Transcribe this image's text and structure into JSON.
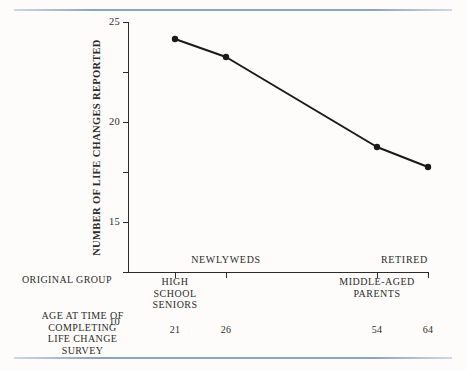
{
  "chart_data": {
    "type": "line",
    "title": "",
    "xlabel": "",
    "ylabel": "NUMBER OF LIFE CHANGES REPORTED",
    "ylim": [
      0,
      25
    ],
    "yticks": [
      0,
      5,
      10,
      15,
      20,
      25
    ],
    "ytick_labels": [
      "0",
      "5",
      "10",
      "15",
      "20",
      "25"
    ],
    "grid": false,
    "legend": "none",
    "categories": [
      "HIGH SCHOOL SENIORS",
      "NEWLYWEDS",
      "MIDDLE-AGED PARENTS",
      "RETIRED"
    ],
    "x": [
      21,
      26,
      54,
      64
    ],
    "values": [
      23.3,
      21.5,
      12.5,
      10.5
    ],
    "marker": "filled-circle",
    "line_color": "#1a1a1a"
  },
  "axis": {
    "y_title": "NUMBER OF LIFE CHANGES REPORTED",
    "y_ticks": [
      {
        "value": 25,
        "label": "25"
      },
      {
        "value": 20,
        "label": "20"
      },
      {
        "value": 15,
        "label": "15"
      },
      {
        "value": 10,
        "label": "10"
      },
      {
        "value": 5,
        "label": "5"
      },
      {
        "value": 0,
        "label": "0"
      }
    ]
  },
  "rows": {
    "group_title": "ORIGINAL GROUP",
    "age_title_lines": [
      "AGE AT TIME OF",
      "COMPLETING",
      "LIFE CHANGE",
      "SURVEY"
    ]
  },
  "points": [
    {
      "group_label_lines": [
        "HIGH",
        "SCHOOL",
        "SENIORS"
      ],
      "group_label_position": "below-axis",
      "age": "21",
      "value": 23.3
    },
    {
      "group_label_lines": [
        "NEWLYWEDS"
      ],
      "group_label_position": "above-axis",
      "age": "26",
      "value": 21.5
    },
    {
      "group_label_lines": [
        "MIDDLE-AGED",
        "PARENTS"
      ],
      "group_label_position": "below-axis",
      "age": "54",
      "value": 12.5
    },
    {
      "group_label_lines": [
        "RETIRED"
      ],
      "group_label_position": "above-axis",
      "age": "64",
      "value": 10.5
    }
  ],
  "colors": {
    "background": "#fdfcfa",
    "rule": "#8ea4bb",
    "ink": "#2b2b2b",
    "line": "#1a1a1a"
  }
}
